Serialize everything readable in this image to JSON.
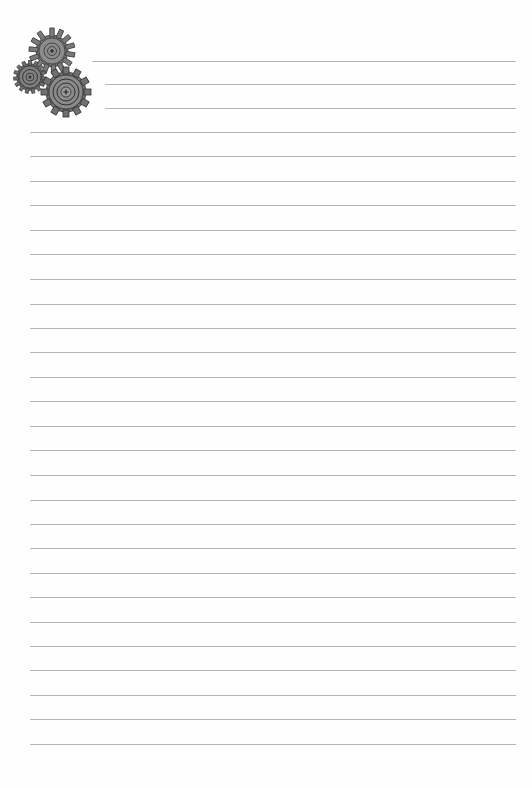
{
  "page": {
    "type": "lined-notebook-paper",
    "background": "#fefefe",
    "line_color": "#b4b4b4",
    "ornament": "gears-icon",
    "lines": [
      {
        "y": 61,
        "x1": 92,
        "x2": 516
      },
      {
        "y": 84,
        "x1": 105,
        "x2": 516
      },
      {
        "y": 108,
        "x1": 105,
        "x2": 516
      },
      {
        "y": 132,
        "x1": 30,
        "x2": 516
      },
      {
        "y": 156,
        "x1": 30,
        "x2": 516
      },
      {
        "y": 181,
        "x1": 30,
        "x2": 516
      },
      {
        "y": 205,
        "x1": 30,
        "x2": 516
      },
      {
        "y": 230,
        "x1": 30,
        "x2": 516
      },
      {
        "y": 254,
        "x1": 30,
        "x2": 516
      },
      {
        "y": 279,
        "x1": 30,
        "x2": 516
      },
      {
        "y": 304,
        "x1": 30,
        "x2": 516
      },
      {
        "y": 328,
        "x1": 30,
        "x2": 516
      },
      {
        "y": 352,
        "x1": 30,
        "x2": 516
      },
      {
        "y": 377,
        "x1": 30,
        "x2": 516
      },
      {
        "y": 401,
        "x1": 30,
        "x2": 516
      },
      {
        "y": 426,
        "x1": 30,
        "x2": 516
      },
      {
        "y": 450,
        "x1": 30,
        "x2": 516
      },
      {
        "y": 475,
        "x1": 30,
        "x2": 516
      },
      {
        "y": 500,
        "x1": 30,
        "x2": 516
      },
      {
        "y": 524,
        "x1": 30,
        "x2": 516
      },
      {
        "y": 548,
        "x1": 30,
        "x2": 516
      },
      {
        "y": 573,
        "x1": 30,
        "x2": 516
      },
      {
        "y": 597,
        "x1": 30,
        "x2": 516
      },
      {
        "y": 622,
        "x1": 30,
        "x2": 516
      },
      {
        "y": 646,
        "x1": 30,
        "x2": 516
      },
      {
        "y": 670,
        "x1": 30,
        "x2": 516
      },
      {
        "y": 695,
        "x1": 30,
        "x2": 516
      },
      {
        "y": 719,
        "x1": 30,
        "x2": 516
      },
      {
        "y": 744,
        "x1": 30,
        "x2": 516
      }
    ]
  }
}
